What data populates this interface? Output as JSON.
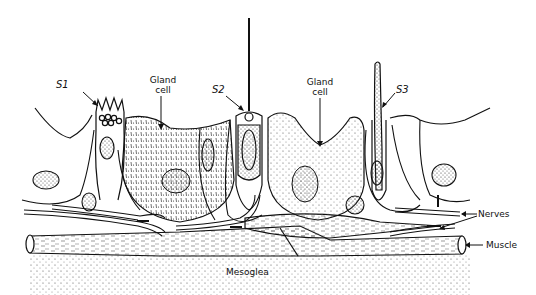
{
  "diagram": {
    "labels": {
      "s1": "S1",
      "s2": "S2",
      "s3": "S3",
      "gland_cell_left_line1": "Gland",
      "gland_cell_left_line2": "cell",
      "gland_cell_right_line1": "Gland",
      "gland_cell_right_line2": "cell",
      "nerves": "Nerves",
      "muscle": "Muscle",
      "mesoglea": "Mesoglea"
    },
    "colors": {
      "ink": "#111111",
      "background": "#ffffff",
      "stipple": "#555555"
    }
  }
}
